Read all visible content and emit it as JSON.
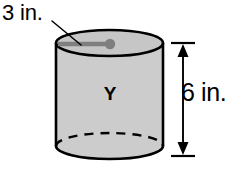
{
  "figure": {
    "type": "geometry-solid-diagram",
    "shape": "cylinder",
    "solid_label": "Y",
    "radius_label": "3 in.",
    "height_label": "6 in.",
    "units": "in.",
    "radius_value": 3,
    "height_value": 6,
    "colors": {
      "body_fill": "#cccccc",
      "top_fill": "#c4c4c4",
      "outline": "#000000",
      "radius_line": "#7f7f7f",
      "center_dot": "#7f7f7f",
      "leader_line": "#000000",
      "dimension_arrow": "#000000",
      "background": "#ffffff"
    },
    "geometry": {
      "left_x": 56,
      "right_x": 163,
      "top_center_y": 43,
      "bottom_center_y": 146,
      "ellipse_ry": 13,
      "radius_dot_x": 110,
      "radius_dot_y": 44,
      "dimension_line_x": 183,
      "dimension_top_y": 43,
      "dimension_bottom_y": 156
    },
    "hidden_edge_style": "dashed",
    "visible_edge_style": "solid"
  }
}
